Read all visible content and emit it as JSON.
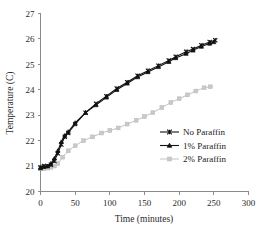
{
  "chart_data": {
    "type": "line",
    "title": "",
    "xlabel": "Time (minutes)",
    "ylabel": "Temperature (C)",
    "xlim": [
      0,
      300
    ],
    "ylim": [
      20,
      27
    ],
    "xticks": [
      0,
      50,
      100,
      150,
      200,
      250,
      300
    ],
    "yticks": [
      20,
      21,
      22,
      23,
      24,
      25,
      26,
      27
    ],
    "xtick_labels": [
      "0",
      "50",
      "100",
      "150",
      "200",
      "250",
      "300"
    ],
    "ytick_labels": [
      "20",
      "21",
      "22",
      "23",
      "24",
      "25",
      "26",
      "27"
    ],
    "grid": false,
    "legend_position": "center-right",
    "series": [
      {
        "name": "No Paraffin",
        "color": "#111111",
        "marker": "cross",
        "x": [
          0,
          5,
          10,
          15,
          20,
          25,
          30,
          35,
          40,
          50,
          65,
          80,
          95,
          110,
          125,
          140,
          155,
          170,
          185,
          195,
          210,
          220,
          232,
          244,
          252
        ],
        "y": [
          20.95,
          21.0,
          21.0,
          21.05,
          21.2,
          21.5,
          21.85,
          22.15,
          22.3,
          22.65,
          23.1,
          23.45,
          23.75,
          24.05,
          24.3,
          24.55,
          24.75,
          24.95,
          25.15,
          25.3,
          25.5,
          25.6,
          25.75,
          25.88,
          25.95
        ]
      },
      {
        "name": "1% Paraffin",
        "color": "#111111",
        "marker": "triangle",
        "x": [
          0,
          5,
          10,
          15,
          20,
          25,
          30,
          35,
          40,
          50,
          65,
          80,
          95,
          110,
          125,
          140,
          155,
          170,
          185,
          195,
          210,
          220,
          232,
          244,
          250
        ],
        "y": [
          20.92,
          20.97,
          21.0,
          21.1,
          21.3,
          21.6,
          21.95,
          22.2,
          22.35,
          22.7,
          23.1,
          23.4,
          23.7,
          24.0,
          24.25,
          24.5,
          24.7,
          24.9,
          25.1,
          25.25,
          25.42,
          25.55,
          25.7,
          25.82,
          25.88
        ]
      },
      {
        "name": "2% Paraffin",
        "color": "#c9c9c9",
        "marker": "square",
        "x": [
          0,
          5,
          10,
          15,
          20,
          25,
          32,
          40,
          50,
          62,
          75,
          88,
          100,
          112,
          125,
          138,
          150,
          162,
          175,
          188,
          200,
          212,
          224,
          236,
          245
        ],
        "y": [
          20.9,
          20.9,
          20.92,
          20.95,
          21.0,
          21.1,
          21.35,
          21.6,
          21.8,
          22.0,
          22.15,
          22.3,
          22.4,
          22.5,
          22.65,
          22.8,
          22.95,
          23.1,
          23.3,
          23.5,
          23.65,
          23.8,
          23.95,
          24.08,
          24.12
        ]
      }
    ]
  },
  "legend": {
    "items": [
      {
        "label": "No Paraffin",
        "marker": "cross-marker",
        "color": "#111111"
      },
      {
        "label": "1% Paraffin",
        "marker": "triangle-marker",
        "color": "#111111"
      },
      {
        "label": "2% Paraffin",
        "marker": "square-marker",
        "color": "#c9c9c9"
      }
    ]
  }
}
